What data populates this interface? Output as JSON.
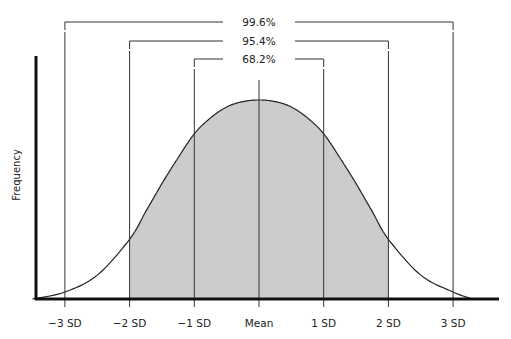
{
  "chart_data": {
    "type": "area",
    "title": "",
    "xlabel": "",
    "ylabel": "Frequency",
    "x_ticks": [
      {
        "sd": -3,
        "label": "−3 SD"
      },
      {
        "sd": -2,
        "label": "−2 SD"
      },
      {
        "sd": -1,
        "label": "−1 SD"
      },
      {
        "sd": 0,
        "label": "Mean"
      },
      {
        "sd": 1,
        "label": "1 SD"
      },
      {
        "sd": 2,
        "label": "2 SD"
      },
      {
        "sd": 3,
        "label": "3 SD"
      }
    ],
    "xlim": [
      -3.5,
      3.7
    ],
    "ylim": [
      0,
      1.0
    ],
    "curve": {
      "x": [
        -3.5,
        -3.0,
        -2.5,
        -2.0,
        -1.75,
        -1.5,
        -1.25,
        -1.0,
        -0.75,
        -0.5,
        -0.25,
        0,
        0.25,
        0.5,
        0.75,
        1.0,
        1.25,
        1.5,
        1.75,
        2.0,
        2.5,
        3.0,
        3.3
      ],
      "y": [
        0.0,
        0.035,
        0.12,
        0.3,
        0.44,
        0.58,
        0.71,
        0.83,
        0.91,
        0.965,
        0.992,
        1.0,
        0.992,
        0.965,
        0.91,
        0.83,
        0.71,
        0.58,
        0.44,
        0.3,
        0.12,
        0.035,
        0.0
      ]
    },
    "shaded_region": {
      "from_sd": -2,
      "to_sd": 2,
      "color": "#cccccc"
    },
    "brackets": [
      {
        "label": "99.6%",
        "from_sd": -3,
        "to_sd": 3
      },
      {
        "label": "95.4%",
        "from_sd": -2,
        "to_sd": 2
      },
      {
        "label": "68.2%",
        "from_sd": -1,
        "to_sd": 1
      }
    ],
    "grid": false,
    "legend": "none"
  }
}
